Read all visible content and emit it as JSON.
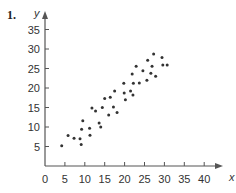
{
  "problem_number": "1.",
  "chart_data": {
    "type": "scatter",
    "title": "",
    "xlabel": "x",
    "ylabel": "y",
    "xlim": [
      0,
      40
    ],
    "ylim": [
      0,
      35
    ],
    "grid": false,
    "legend": null,
    "x_ticks": [
      0,
      5,
      10,
      15,
      20,
      25,
      30,
      35,
      40
    ],
    "y_ticks": [
      5,
      10,
      15,
      20,
      25,
      30,
      35
    ],
    "points": [
      [
        4.2,
        5.2
      ],
      [
        5.8,
        7.8
      ],
      [
        7.3,
        7.1
      ],
      [
        8.8,
        7.0
      ],
      [
        9.1,
        5.5
      ],
      [
        9.2,
        9.4
      ],
      [
        9.5,
        11.6
      ],
      [
        11.2,
        9.7
      ],
      [
        11.3,
        7.9
      ],
      [
        11.8,
        14.9
      ],
      [
        12.7,
        14.1
      ],
      [
        13.6,
        11.0
      ],
      [
        14.0,
        10.0
      ],
      [
        14.4,
        15.0
      ],
      [
        15.0,
        17.3
      ],
      [
        16.4,
        17.6
      ],
      [
        16.0,
        13.1
      ],
      [
        17.2,
        15.1
      ],
      [
        18.1,
        13.7
      ],
      [
        17.5,
        19.2
      ],
      [
        19.9,
        18.7
      ],
      [
        20.2,
        17.0
      ],
      [
        21.5,
        19.2
      ],
      [
        22.1,
        18.2
      ],
      [
        19.8,
        21.2
      ],
      [
        22.2,
        21.2
      ],
      [
        23.7,
        21.3
      ],
      [
        25.6,
        22.0
      ],
      [
        21.9,
        23.6
      ],
      [
        24.6,
        24.4
      ],
      [
        26.6,
        23.8
      ],
      [
        27.8,
        23.0
      ],
      [
        22.9,
        25.6
      ],
      [
        26.9,
        25.6
      ],
      [
        25.8,
        27.1
      ],
      [
        27.3,
        28.7
      ],
      [
        29.4,
        27.8
      ],
      [
        29.6,
        25.9
      ],
      [
        30.7,
        25.9
      ]
    ],
    "colors": {
      "axis": "#555555",
      "point": "#333333",
      "text": "#444444"
    }
  }
}
